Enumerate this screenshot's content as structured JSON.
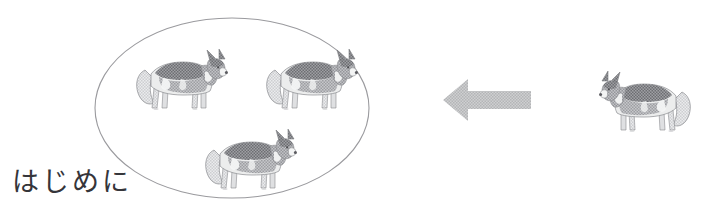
{
  "figure": {
    "caption": "はじめに",
    "background_color": "#ffffff",
    "width": 720,
    "height": 214
  },
  "grouping": {
    "ellipse": {
      "label": "group-ellipse",
      "center_x": 232,
      "center_y": 108,
      "radius_x": 137,
      "radius_y": 90,
      "stroke_color": "#9a9a9e",
      "stroke_width": 1.1,
      "fill": "none"
    },
    "members": [
      {
        "label": "husky-in-group-1",
        "x": 135,
        "y": 44,
        "width": 92,
        "height": 68,
        "facing": "right"
      },
      {
        "label": "husky-in-group-2",
        "x": 265,
        "y": 44,
        "width": 92,
        "height": 68,
        "facing": "right"
      },
      {
        "label": "husky-in-group-3",
        "x": 204,
        "y": 124,
        "width": 92,
        "height": 68,
        "facing": "right"
      }
    ],
    "member_count": 3
  },
  "arrow": {
    "label": "leftward-arrow",
    "direction": "left",
    "x": 443,
    "y": 79,
    "width": 88,
    "height": 42,
    "fill_color": "#c3c3c4"
  },
  "instance": {
    "label": "husky-single",
    "x": 598,
    "y": 62,
    "width": 94,
    "height": 78,
    "facing": "left"
  },
  "palette": {
    "fur_dark": "#77787c",
    "fur_mid": "#9c9da1",
    "fur_light": "#c9cacd",
    "fur_pale": "#e8e9ea",
    "outline": "#8a8b8f",
    "eye": "#4a4a4e",
    "nose": "#5b5b60",
    "text": "#35353a"
  }
}
